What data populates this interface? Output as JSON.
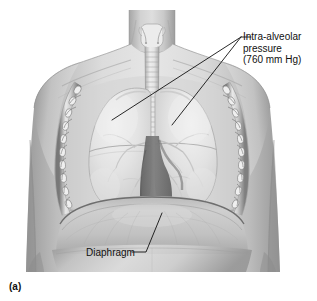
{
  "figure": {
    "panel_letter": "(a)",
    "background_color": "#ffffff",
    "line_color": "#111111",
    "text_color": "#111111"
  },
  "labels": {
    "intra_alveolar": {
      "name": "intra-alveolar-pressure-label",
      "line1": "Intra-alveolar",
      "line2": "pressure",
      "line3": "(760 mm Hg)",
      "pressure_value": "760",
      "pressure_units": "mm Hg"
    },
    "diaphragm": {
      "name": "diaphragm-label",
      "text": "Diaphragm"
    }
  },
  "anatomy": {
    "parts": [
      {
        "id": "neck",
        "label": "neck"
      },
      {
        "id": "larynx",
        "label": "larynx"
      },
      {
        "id": "trachea",
        "label": "trachea"
      },
      {
        "id": "left-lung",
        "label": "left lung"
      },
      {
        "id": "right-lung",
        "label": "right lung"
      },
      {
        "id": "rib-cage-left",
        "label": "left rib cage"
      },
      {
        "id": "rib-cage-right",
        "label": "right rib cage"
      },
      {
        "id": "mediastinum",
        "label": "mediastinum"
      },
      {
        "id": "diaphragm",
        "label": "diaphragm"
      },
      {
        "id": "abdomen",
        "label": "abdomen"
      },
      {
        "id": "shoulder-left",
        "label": "left shoulder"
      },
      {
        "id": "shoulder-right",
        "label": "right shoulder"
      }
    ]
  },
  "leader_lines": {
    "intra_alveolar_hub": {
      "x": 241,
      "y": 37
    },
    "intra_alveolar_target_left": {
      "x": 112,
      "y": 120
    },
    "intra_alveolar_target_right": {
      "x": 172,
      "y": 125
    },
    "diaphragm_elbow": {
      "x": 146,
      "y": 252
    },
    "diaphragm_target": {
      "x": 162,
      "y": 213
    }
  },
  "colors": {
    "skin_light": "#e2e2e2",
    "skin_mid": "#c9c9c9",
    "skin_dark": "#a8a8a8",
    "skin_shadow": "#8c8c8c",
    "lung_light": "#ededed",
    "lung_mid": "#d6d6d6",
    "rib_light": "#f0f0f0",
    "rib_dark": "#7d7d7d",
    "mediastinum": "#6f6f6f",
    "outline": "#111111"
  }
}
